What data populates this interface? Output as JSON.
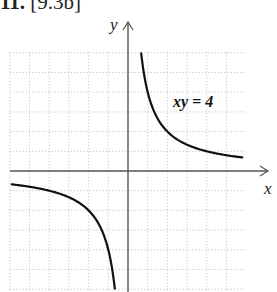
{
  "header": {
    "number": "11.",
    "reference": "[9.3b]"
  },
  "chart_data": {
    "type": "line",
    "title": "",
    "equation_label": "xy = 4",
    "xlabel": "x",
    "ylabel": "y",
    "xlim": [
      -6,
      6
    ],
    "ylim": [
      -6,
      6
    ],
    "grid": true,
    "grid_style": "dotted",
    "grid_step": 1,
    "legend": null,
    "series": [
      {
        "name": "xy = 4 (first quadrant branch)",
        "x": [
          0.67,
          0.8,
          1,
          1.25,
          1.5,
          2,
          2.5,
          3,
          3.5,
          4,
          4.5,
          5,
          5.5,
          5.8
        ],
        "y": [
          6,
          5,
          4,
          3.2,
          2.67,
          2,
          1.6,
          1.33,
          1.14,
          1,
          0.89,
          0.8,
          0.73,
          0.69
        ]
      },
      {
        "name": "xy = 4 (third quadrant branch)",
        "x": [
          -5.9,
          -5.5,
          -5,
          -4.5,
          -4,
          -3.5,
          -3,
          -2.5,
          -2,
          -1.5,
          -1.25,
          -1,
          -0.8,
          -0.67
        ],
        "y": [
          -0.68,
          -0.73,
          -0.8,
          -0.89,
          -1,
          -1.14,
          -1.33,
          -1.6,
          -2,
          -2.67,
          -3.2,
          -4,
          -5,
          -6
        ]
      }
    ],
    "colors": {
      "curve": "#111111",
      "axis": "#555555",
      "grid": "#b8b8b8"
    }
  }
}
